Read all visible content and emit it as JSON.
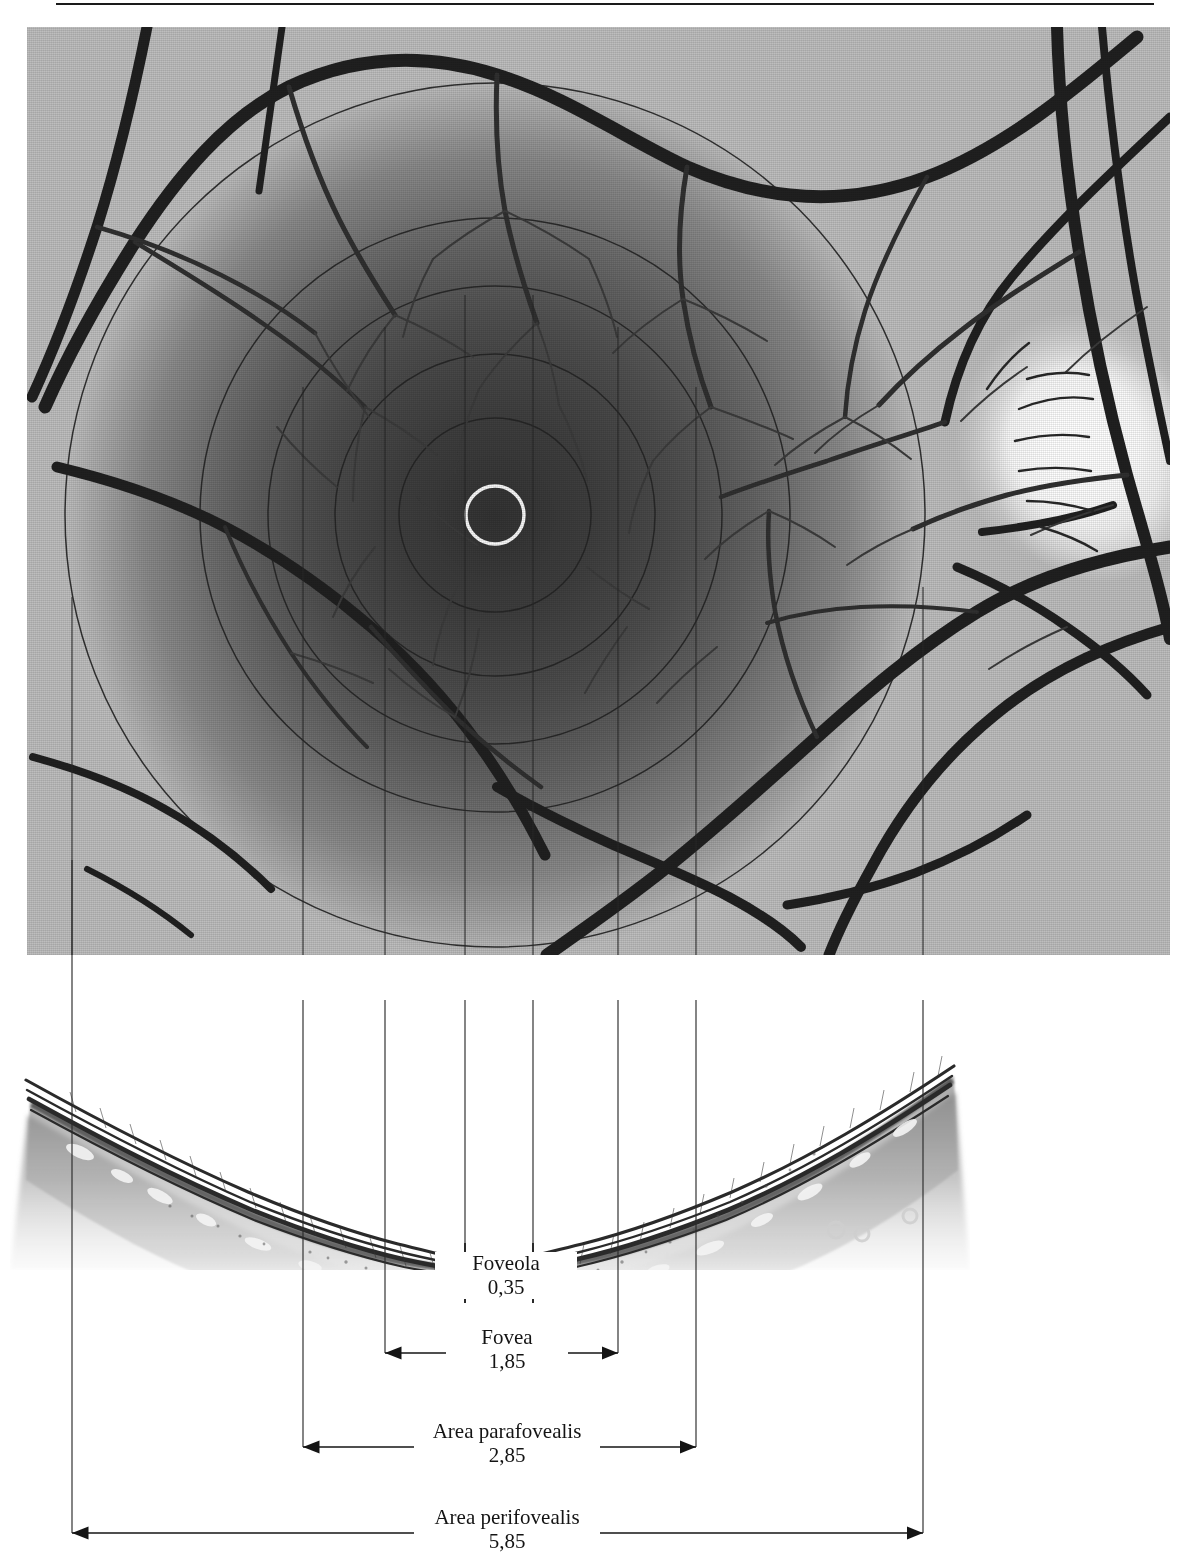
{
  "figure": {
    "title_visible": false,
    "panels": {
      "top": "fundus-photograph-of-macula",
      "bottom": "histological-cross-section-of-fovea"
    }
  },
  "measurements": [
    {
      "id": "foveola",
      "label": "Foveola",
      "value": "0,35",
      "unit_implied": "mm",
      "left_px": 465,
      "right_px": 533,
      "label_y": 1265,
      "style": "ticks"
    },
    {
      "id": "fovea",
      "label": "Fovea",
      "value": "1,85",
      "unit_implied": "mm",
      "left_px": 385,
      "right_px": 618,
      "label_y": 1336,
      "style": "arrows"
    },
    {
      "id": "area-parafovealis",
      "label": "Area parafovealis",
      "value": "2,85",
      "unit_implied": "mm",
      "left_px": 303,
      "right_px": 696,
      "label_y": 1430,
      "style": "arrows"
    },
    {
      "id": "area-perifovealis",
      "label": "Area perifovealis",
      "value": "5,85",
      "unit_implied": "mm",
      "left_px": 72,
      "right_px": 923,
      "label_y": 1516,
      "style": "arrows"
    }
  ],
  "guide_lines_x": [
    72,
    303,
    385,
    465,
    533,
    618,
    696,
    923
  ],
  "fundus": {
    "center_marker": "foveola-ring",
    "center_x": 495,
    "center_y": 515,
    "ring_radius": 30,
    "concentric_rings_radius": [
      30,
      96,
      160,
      227,
      295,
      430
    ],
    "optic_disc_x": 1075,
    "optic_disc_y": 440
  },
  "colors": {
    "ink": "#141414",
    "guide_line": "#2b2b2b",
    "paper": "#ffffff",
    "macula_dark": "#3b3b3b",
    "retina_mid": "#8a8a8a",
    "fundus_light": "#e8e8e8"
  }
}
